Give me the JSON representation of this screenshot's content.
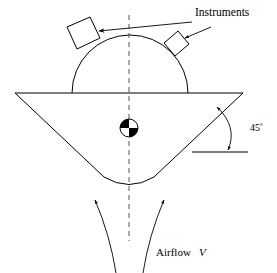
{
  "figure": {
    "type": "engineering-schematic",
    "background_color": "#ffffff",
    "line_color": "#000000",
    "centerline_color": "#555555",
    "width": 277,
    "height": 273
  },
  "labels": {
    "instruments": "Instruments",
    "airflow": "Airflow",
    "airflow_speed_symbol": "V",
    "angle_value": "45",
    "angle_degree_symbol": "°"
  },
  "annotations": {
    "angle": {
      "value": 45,
      "unit": "degrees",
      "measured_between": "cone-right-edge and horizontal-reference-line"
    },
    "instrument_count": 2,
    "instrument_positions": [
      "upper-left-of-dome",
      "upper-right-of-dome"
    ],
    "airflow_direction": "upward",
    "airflow_streamline_count": 2
  },
  "geometry": {
    "dome": {
      "center_x": 130,
      "base_y": 93,
      "radius": 58
    },
    "cone": {
      "left_tip": [
        15,
        93
      ],
      "right_tip": [
        243,
        93
      ],
      "apex_y": 186,
      "half_angle_deg": 45
    },
    "centerline": {
      "x": 129,
      "y_top": 15,
      "y_bottom": 241
    },
    "center_of_gravity": {
      "x": 129,
      "y": 128,
      "radius": 9,
      "symbol": "cg-quadrant-circle"
    },
    "reference_line": {
      "y": 152,
      "x_start": 192,
      "x_end": 248
    }
  }
}
